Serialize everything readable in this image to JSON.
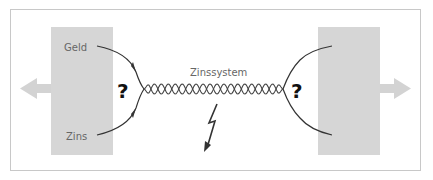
{
  "diagram": {
    "labels": {
      "geld": "Geld",
      "zins": "Zins",
      "system": "Zinssystem",
      "question_left": "?",
      "question_right": "?"
    },
    "colors": {
      "box": "#d6d6d6",
      "arrow": "#d3d3d3",
      "line": "#333333",
      "frame": "#c8c8c8"
    },
    "footer_mark": "\""
  }
}
